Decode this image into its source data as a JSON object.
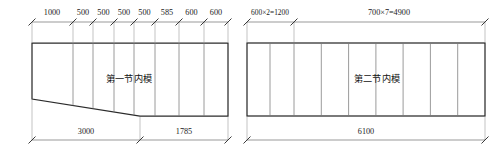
{
  "drawing": {
    "background_color": "#ffffff",
    "line_color": "#2b2b2b",
    "dimension_color": "#6e6e6e",
    "panels": [
      {
        "id": "panel-left",
        "label": "第一节内模",
        "top_dimensions": [
          "1000",
          "500",
          "500",
          "500",
          "500",
          "585",
          "600",
          "600"
        ],
        "bottom_dimensions": [
          "3000",
          "1785"
        ],
        "total_width": "4785"
      },
      {
        "id": "panel-right",
        "label": "第二节内模",
        "top_dimensions": [
          "600×2=1200",
          "700×7=4900"
        ],
        "bottom_dimensions": [
          "6100"
        ],
        "total_width": "6100"
      }
    ]
  }
}
